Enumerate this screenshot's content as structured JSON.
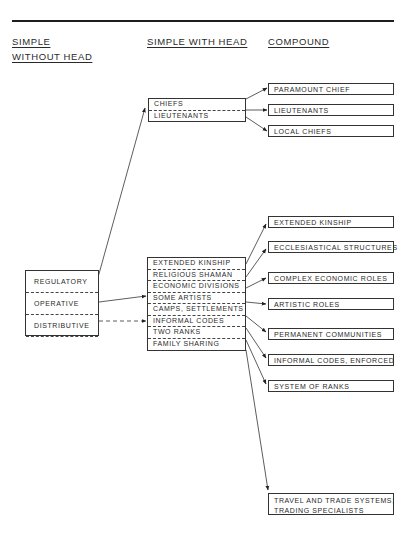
{
  "headers": {
    "col1_line1": "SIMPLE",
    "col1_line2": "WITHOUT HEAD",
    "col2": "SIMPLE WITH HEAD",
    "col3": "COMPOUND"
  },
  "simple_without_head": [
    "REGULATORY",
    "OPERATIVE",
    "DISTRIBUTIVE"
  ],
  "simple_with_head_top": [
    "CHIEFS",
    "LIEUTENANTS"
  ],
  "simple_with_head_bottom": [
    "EXTENDED KINSHIP",
    "RELIGIOUS SHAMAN",
    "ECONOMIC DIVISIONS",
    "SOME ARTISTS",
    "CAMPS, SETTLEMENTS",
    "INFORMAL CODES",
    "TWO RANKS",
    "FAMILY SHARING"
  ],
  "compound_top": [
    "PARAMOUNT CHIEF",
    "LIEUTENANTS",
    "LOCAL CHIEFS"
  ],
  "compound_bottom": [
    "EXTENDED KINSHIP",
    "ECCLESIASTICAL STRUCTURES",
    "COMPLEX ECONOMIC ROLES",
    "ARTISTIC ROLES",
    "PERMANENT COMMUNITIES",
    "INFORMAL CODES, ENFORCED",
    "SYSTEM OF RANKS"
  ],
  "compound_trade_line1": "TRAVEL AND TRADE SYSTEMS;",
  "compound_trade_line2": "TRADING SPECIALISTS",
  "connections": [
    {
      "from": "REGULATORY",
      "to": "CHIEFS / LIEUTENANTS",
      "style": "solid"
    },
    {
      "from": "OPERATIVE",
      "to": "SOME ARTISTS",
      "style": "solid"
    },
    {
      "from": "DISTRIBUTIVE",
      "to": "INFORMAL CODES",
      "style": "dashed"
    },
    {
      "from": "CHIEFS",
      "to": "PARAMOUNT CHIEF",
      "style": "solid"
    },
    {
      "from": "CHIEFS / LIEUTENANTS",
      "to": "LIEUTENANTS",
      "style": "solid"
    },
    {
      "from": "LIEUTENANTS",
      "to": "LOCAL CHIEFS",
      "style": "solid"
    },
    {
      "from": "EXTENDED KINSHIP",
      "to": "EXTENDED KINSHIP",
      "style": "solid"
    },
    {
      "from": "RELIGIOUS SHAMAN",
      "to": "ECCLESIASTICAL STRUCTURES",
      "style": "solid"
    },
    {
      "from": "ECONOMIC DIVISIONS",
      "to": "COMPLEX ECONOMIC ROLES",
      "style": "solid"
    },
    {
      "from": "CAMPS, SETTLEMENTS",
      "to": "ARTISTIC ROLES",
      "style": "solid"
    },
    {
      "from": "INFORMAL CODES",
      "to": "PERMANENT COMMUNITIES",
      "style": "solid"
    },
    {
      "from": "TWO RANKS",
      "to": "INFORMAL CODES, ENFORCED",
      "style": "solid"
    },
    {
      "from": "FAMILY SHARING",
      "to": "SYSTEM OF RANKS",
      "style": "solid"
    },
    {
      "from": "FAMILY SHARING",
      "to": "TRAVEL AND TRADE SYSTEMS; TRADING SPECIALISTS",
      "style": "solid"
    }
  ]
}
